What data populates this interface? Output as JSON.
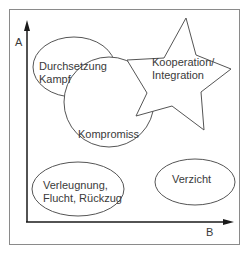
{
  "diagram": {
    "axes": {
      "y_label": "A",
      "x_label": "B"
    },
    "nodes": [
      {
        "id": "durchsetzung",
        "shape": "ellipse",
        "line1": "Durchsetzung",
        "line2": "Kampf"
      },
      {
        "id": "kooperation",
        "shape": "star",
        "line1": "Kooperation/",
        "line2": "Integration"
      },
      {
        "id": "kompromiss",
        "shape": "circle",
        "line1": "Kompromiss"
      },
      {
        "id": "verleugnung",
        "shape": "ellipse",
        "line1": "Verleugnung,",
        "line2": "Flucht, Rückzug"
      },
      {
        "id": "verzicht",
        "shape": "ellipse",
        "line1": "Verzicht"
      }
    ],
    "colors": {
      "stroke": "#555555",
      "axis": "#1a1a1a",
      "frame": "#888888",
      "text": "#3a3a3a"
    }
  }
}
